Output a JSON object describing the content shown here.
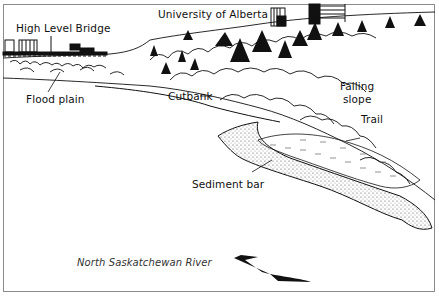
{
  "diagram": {
    "labels": {
      "university": "University of Alberta",
      "bridge": "High Level Bridge",
      "flood_plain": "Flood plain",
      "cutbank": "Cutbank",
      "failing_slope_line1": "Failing",
      "failing_slope_line2": "slope",
      "trail": "Trail",
      "sediment_bar": "Sediment bar",
      "river": "North Saskatchewan River"
    },
    "colors": {
      "ink": "#111111",
      "frame": "#8a8a8a",
      "background": "#ffffff"
    }
  }
}
